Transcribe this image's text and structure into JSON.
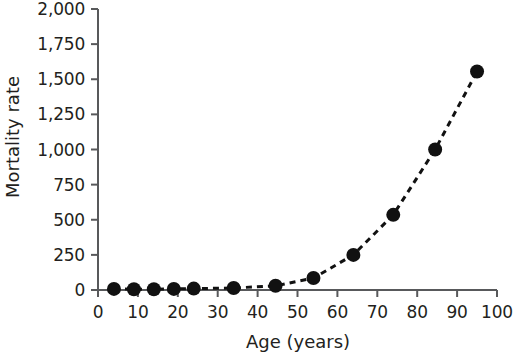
{
  "chart_data": {
    "type": "scatter",
    "title": "",
    "xlabel": "Age (years)",
    "ylabel": "Mortality rate",
    "xlim": [
      0,
      100
    ],
    "ylim": [
      0,
      2000
    ],
    "xticks": [
      0,
      10,
      20,
      30,
      40,
      50,
      60,
      70,
      80,
      90,
      100
    ],
    "xtick_labels": [
      "0",
      "10",
      "20",
      "30",
      "40",
      "50",
      "60",
      "70",
      "80",
      "90",
      "100"
    ],
    "yticks": [
      0,
      250,
      500,
      750,
      1000,
      1250,
      1500,
      1750,
      2000
    ],
    "ytick_labels": [
      "0",
      "250",
      "500",
      "750",
      "1,000",
      "1,250",
      "1,500",
      "1,750",
      "2,000"
    ],
    "grid": false,
    "legend": null,
    "line_style": "dashed",
    "marker": "filled-circle",
    "marker_color": "#111111",
    "line_color": "#111111",
    "x": [
      4,
      9,
      14,
      19,
      24,
      34,
      44.5,
      54,
      64,
      74,
      84.5,
      95
    ],
    "y": [
      8,
      5,
      5,
      8,
      10,
      14,
      30,
      85,
      250,
      535,
      1000,
      1555
    ],
    "series": [
      {
        "name": "Mortality rate by age",
        "points": [
          {
            "x": 4,
            "y": 8
          },
          {
            "x": 9,
            "y": 5
          },
          {
            "x": 14,
            "y": 5
          },
          {
            "x": 19,
            "y": 8
          },
          {
            "x": 24,
            "y": 10
          },
          {
            "x": 34,
            "y": 14
          },
          {
            "x": 44.5,
            "y": 30
          },
          {
            "x": 54,
            "y": 85
          },
          {
            "x": 64,
            "y": 250
          },
          {
            "x": 74,
            "y": 535
          },
          {
            "x": 84.5,
            "y": 1000
          },
          {
            "x": 95,
            "y": 1555
          }
        ]
      }
    ]
  },
  "axes": {
    "y_title": "Mortality rate",
    "x_title": "Age (years)"
  }
}
